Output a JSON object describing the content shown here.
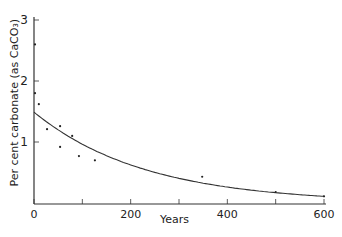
{
  "chart_data": {
    "type": "scatter",
    "title": "",
    "xlabel": "Years",
    "ylabel": "Per cent carbonate (as CaCO₃)",
    "xlim": [
      0,
      600
    ],
    "ylim": [
      0,
      3
    ],
    "x_ticks": [
      0,
      100,
      200,
      300,
      400,
      500,
      600
    ],
    "x_tick_labels": [
      "0",
      "",
      "200",
      "",
      "400",
      "",
      "600"
    ],
    "y_ticks": [
      1,
      2,
      3
    ],
    "y_tick_labels": [
      "1",
      "2",
      "3"
    ],
    "grid": false,
    "legend": null,
    "series": [
      {
        "name": "observations",
        "kind": "scatter",
        "x": [
          0,
          0,
          10,
          27,
          54,
          54,
          79,
          93,
          126,
          348,
          500,
          600
        ],
        "y": [
          2.6,
          1.8,
          1.62,
          1.21,
          1.26,
          0.92,
          1.1,
          0.77,
          0.7,
          0.43,
          0.18,
          0.11
        ]
      },
      {
        "name": "fitted curve",
        "kind": "line",
        "x": [
          0,
          50,
          100,
          150,
          200,
          250,
          300,
          350,
          400,
          450,
          500,
          550,
          600
        ],
        "y": [
          1.49,
          1.19,
          0.95,
          0.76,
          0.6,
          0.48,
          0.38,
          0.31,
          0.25,
          0.2,
          0.15,
          0.13,
          0.11
        ]
      }
    ]
  },
  "axes": {
    "xlabel": "Years",
    "ylabel": "Per cent carbonate (as CaCO₃)"
  }
}
